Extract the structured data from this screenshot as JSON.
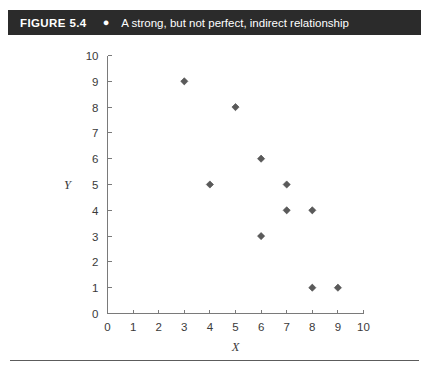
{
  "header": {
    "figure_number": "FIGURE 5.4",
    "bullet": "●",
    "caption": "A strong, but not perfect, indirect relationship",
    "background_color": "#2b2b2b",
    "text_color": "#ffffff"
  },
  "chart_data": {
    "type": "scatter",
    "title": "A strong, but not perfect, indirect relationship",
    "xlabel": "X",
    "ylabel": "Y",
    "xlim": [
      0,
      10
    ],
    "ylim": [
      0,
      10
    ],
    "xticks": [
      0,
      1,
      2,
      3,
      4,
      5,
      6,
      7,
      8,
      9,
      10
    ],
    "yticks": [
      0,
      1,
      2,
      3,
      4,
      5,
      6,
      7,
      8,
      9,
      10
    ],
    "xtick_labels": [
      "0",
      "1",
      "2",
      "3",
      "4",
      "5",
      "6",
      "7",
      "8",
      "9",
      "10"
    ],
    "ytick_labels": [
      "0",
      "1",
      "2",
      "3",
      "4",
      "5",
      "6",
      "7",
      "8",
      "9",
      "10"
    ],
    "grid": false,
    "legend": false,
    "marker": "diamond",
    "marker_color": "#5a5a5a",
    "points": [
      {
        "x": 3,
        "y": 9
      },
      {
        "x": 4,
        "y": 5
      },
      {
        "x": 5,
        "y": 8
      },
      {
        "x": 6,
        "y": 6
      },
      {
        "x": 6,
        "y": 3
      },
      {
        "x": 7,
        "y": 5
      },
      {
        "x": 7,
        "y": 4
      },
      {
        "x": 8,
        "y": 4
      },
      {
        "x": 8,
        "y": 1
      },
      {
        "x": 9,
        "y": 1
      }
    ]
  }
}
